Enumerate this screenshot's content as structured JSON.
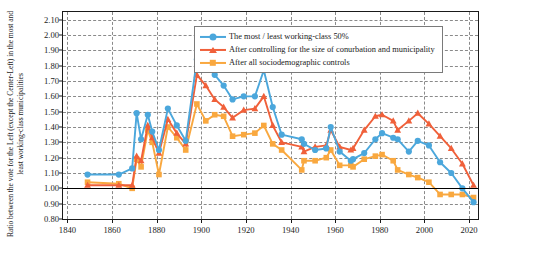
{
  "chart_data": {
    "type": "line",
    "title": "",
    "xlabel": "",
    "ylabel": "Ratio between the vote for the Left (except the Center-Left) in the most and least working-class municipalities",
    "xlim": [
      1838,
      2024
    ],
    "ylim": [
      0.8,
      2.15
    ],
    "xticks": [
      1840,
      1860,
      1880,
      1900,
      1920,
      1940,
      1960,
      1980,
      2000,
      2020
    ],
    "yticks": [
      0.8,
      0.9,
      1.0,
      1.1,
      1.2,
      1.3,
      1.4,
      1.5,
      1.6,
      1.7,
      1.8,
      1.9,
      2.0,
      2.1
    ],
    "ytick_labels": [
      "0.80",
      "0.90",
      "1.00",
      "1.10",
      "1.20",
      "1.30",
      "1.40",
      "1.50",
      "1.60",
      "1.70",
      "1.80",
      "1.90",
      "2.00",
      "2.10"
    ],
    "xtick_labels": [
      "1840",
      "1860",
      "1880",
      "1900",
      "1920",
      "1940",
      "1960",
      "1980",
      "2000",
      "2020"
    ],
    "grid": true,
    "reference_line": 1.0,
    "legend_position": "top-center",
    "colors": {
      "series1": "#4BA7DC",
      "series2": "#F0603A",
      "series3": "#F9A83F",
      "reference": "#000000",
      "grid": "#8a8a8a",
      "axis": "#1a1a1a"
    },
    "x": [
      1849,
      1863,
      1869,
      1871,
      1873,
      1876,
      1878,
      1881,
      1885,
      1889,
      1893,
      1898,
      1902,
      1906,
      1910,
      1914,
      1919,
      1924,
      1928,
      1932,
      1936,
      1945,
      1946,
      1951,
      1956,
      1958,
      1962,
      1967,
      1968,
      1973,
      1978,
      1981,
      1986,
      1988,
      1993,
      1997,
      2002,
      2007,
      2012,
      2017,
      2022
    ],
    "series": [
      {
        "name": "The most / least working-class 50%",
        "marker": "circle",
        "color": "#4BA7DC",
        "values": [
          1.09,
          1.09,
          1.13,
          1.49,
          1.32,
          1.48,
          1.37,
          1.25,
          1.52,
          1.41,
          1.31,
          1.84,
          1.8,
          1.74,
          1.67,
          1.58,
          1.6,
          1.6,
          1.77,
          1.53,
          1.35,
          1.32,
          1.29,
          1.25,
          1.26,
          1.4,
          1.24,
          1.18,
          1.19,
          1.23,
          1.32,
          1.36,
          1.33,
          1.32,
          1.24,
          1.31,
          1.28,
          1.17,
          1.1,
          1.0,
          0.91
        ]
      },
      {
        "name": "After controlling for the size of conurbation and municipality",
        "marker": "triangle",
        "color": "#F0603A",
        "values": [
          1.02,
          1.02,
          1.02,
          1.21,
          1.18,
          1.41,
          1.33,
          1.23,
          1.45,
          1.36,
          1.29,
          1.74,
          1.67,
          1.58,
          1.53,
          1.46,
          1.51,
          1.52,
          1.6,
          1.41,
          1.3,
          1.27,
          1.24,
          1.27,
          1.28,
          1.38,
          1.27,
          1.25,
          1.26,
          1.38,
          1.47,
          1.48,
          1.44,
          1.38,
          1.44,
          1.49,
          1.42,
          1.34,
          1.26,
          1.16,
          1.02
        ]
      },
      {
        "name": "After all sociodemographic controls",
        "marker": "square",
        "color": "#F9A83F",
        "values": [
          1.04,
          1.03,
          1.0,
          1.19,
          1.14,
          1.38,
          1.3,
          1.09,
          1.4,
          1.33,
          1.25,
          1.55,
          1.44,
          1.48,
          1.47,
          1.34,
          1.35,
          1.36,
          1.41,
          1.29,
          1.25,
          1.12,
          1.18,
          1.18,
          1.2,
          1.25,
          1.15,
          1.15,
          1.14,
          1.19,
          1.21,
          1.22,
          1.18,
          1.12,
          1.09,
          1.07,
          1.04,
          0.96,
          0.96,
          0.96,
          0.94
        ]
      }
    ]
  },
  "legend": {
    "items": [
      {
        "label": "The most / least working-class 50%",
        "marker": "circle-marker",
        "color": "#4BA7DC"
      },
      {
        "label": "After controlling for the size of conurbation and municipality",
        "marker": "triangle-marker",
        "color": "#F0603A"
      },
      {
        "label": "After all sociodemographic controls",
        "marker": "square-marker",
        "color": "#F9A83F"
      }
    ]
  }
}
